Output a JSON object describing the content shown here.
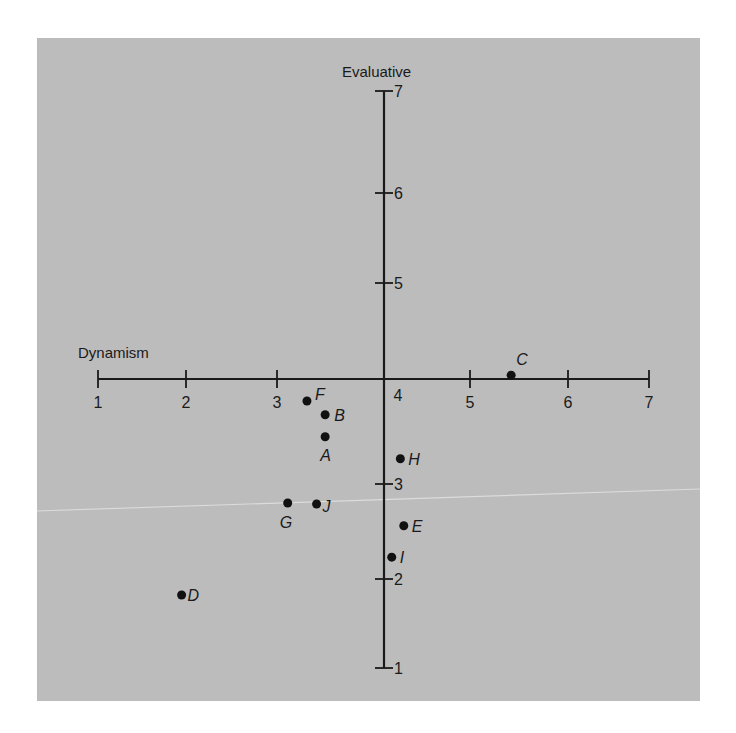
{
  "chart_data": {
    "type": "scatter",
    "title": "",
    "xlabel": "Dynamism",
    "ylabel": "Evaluative",
    "xlim": [
      1,
      7
    ],
    "ylim": [
      1,
      7
    ],
    "x_ticks": [
      1,
      2,
      3,
      4,
      5,
      6,
      7
    ],
    "y_ticks": [
      1,
      2,
      3,
      4,
      5,
      6,
      7
    ],
    "axes_cross_at": {
      "x": 4,
      "y": 4
    },
    "grid": false,
    "legend": "none",
    "points": [
      {
        "label": "A",
        "x": 3.45,
        "y": 3.45
      },
      {
        "label": "B",
        "x": 3.45,
        "y": 3.66
      },
      {
        "label": "C",
        "x": 5.42,
        "y": 4.04
      },
      {
        "label": "D",
        "x": 1.95,
        "y": 1.82
      },
      {
        "label": "E",
        "x": 4.23,
        "y": 2.56
      },
      {
        "label": "F",
        "x": 3.28,
        "y": 3.79
      },
      {
        "label": "G",
        "x": 3.1,
        "y": 2.8
      },
      {
        "label": "H",
        "x": 4.19,
        "y": 3.24
      },
      {
        "label": "I",
        "x": 4.09,
        "y": 2.23
      },
      {
        "label": "J",
        "x": 3.37,
        "y": 2.79
      }
    ]
  },
  "colors": {
    "panel": "#bcbcbc",
    "ink": "#1a1a1a",
    "page": "#ffffff"
  },
  "layout": {
    "x_pixels": [
      98,
      186,
      277,
      384,
      470,
      568,
      649
    ],
    "y_pixels": [
      668,
      579,
      484,
      379,
      283,
      193,
      91
    ],
    "x_axis_y": 379,
    "y_axis_x": 384,
    "point_label_offsets": {
      "A": [
        -5,
        24,
        "start"
      ],
      "B": [
        9,
        6,
        "start"
      ],
      "C": [
        5,
        -10,
        "start"
      ],
      "D": [
        6,
        6,
        "start"
      ],
      "E": [
        8,
        6,
        "start"
      ],
      "F": [
        8,
        -1,
        "start"
      ],
      "G": [
        -8,
        25,
        "start"
      ],
      "H": [
        8,
        6,
        "start"
      ],
      "I": [
        8,
        6,
        "start"
      ],
      "J": [
        6,
        8,
        "start"
      ]
    }
  }
}
